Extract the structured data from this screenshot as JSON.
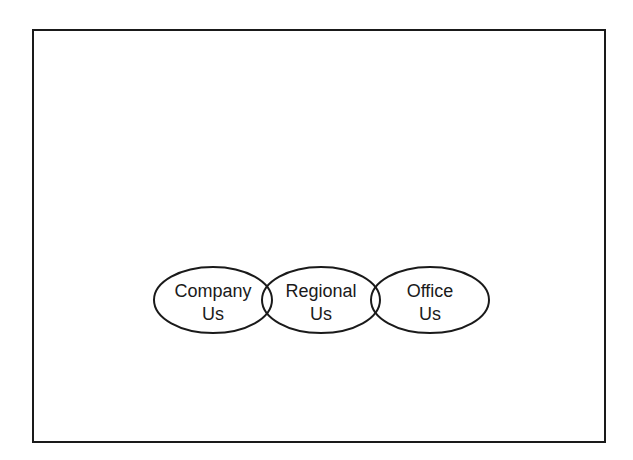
{
  "diagram": {
    "frame": {
      "x": 32,
      "y": 29,
      "width": 572,
      "height": 412
    },
    "stroke_color": "#1a1a1a",
    "ellipses": [
      {
        "id": "company",
        "cx": 213,
        "cy": 300,
        "rx": 59,
        "ry": 33,
        "line1": "Company",
        "line2": "Us"
      },
      {
        "id": "regional",
        "cx": 321,
        "cy": 300,
        "rx": 59,
        "ry": 33,
        "line1": "Regional",
        "line2": "Us"
      },
      {
        "id": "office",
        "cx": 430,
        "cy": 300,
        "rx": 59,
        "ry": 33,
        "line1": "Office",
        "line2": "Us"
      }
    ]
  }
}
